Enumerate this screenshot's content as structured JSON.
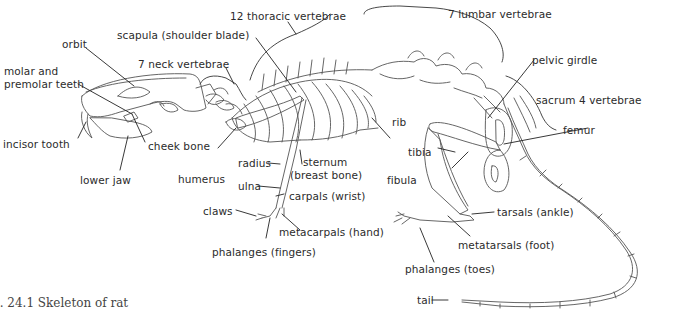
{
  "figure": {
    "caption": "g. 24.1   Skeleton of rat",
    "labels": {
      "orbit": "orbit",
      "scapula": "scapula (shoulder blade)",
      "thoracic": "12 thoracic vertebrae",
      "lumbar": "7 lumbar vertebrae",
      "neck": "7 neck vertebrae",
      "molar_1": "molar and",
      "molar_2": "premolar teeth",
      "pelvic": "pelvic girdle",
      "rib": "rib",
      "sacrum": "sacrum 4 vertebrae",
      "incisor": "incisor tooth",
      "cheek": "cheek bone",
      "femur": "femur",
      "tibia": "tibia",
      "radius": "radius",
      "sternum_1": "sternum",
      "sternum_2": "(breast bone)",
      "humerus": "humerus",
      "lower_jaw": "lower jaw",
      "fibula": "fibula",
      "ulna": "ulna",
      "carpals": "carpals (wrist)",
      "claws": "claws",
      "tarsals": "tarsals (ankle)",
      "metacarpals": "metacarpals (hand)",
      "metatarsals": "metatarsals (foot)",
      "phalanges_fingers": "phalanges (fingers)",
      "phalanges_toes": "phalanges (toes)",
      "tail": "tail"
    }
  }
}
